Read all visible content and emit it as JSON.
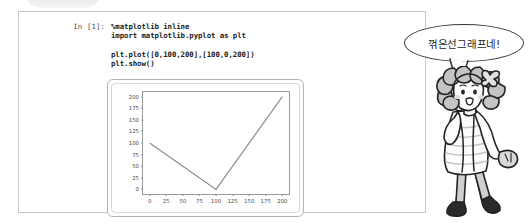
{
  "notebook": {
    "prompt_label": "In [1]:",
    "code_lines": [
      "%matplotlib inline",
      "import matplotlib.pyplot as plt",
      "",
      "plt.plot([0,100,200],[100,0,200])",
      "plt.show()"
    ],
    "code_line_1": "%matplotlib inline",
    "code_line_2": "import matplotlib.pyplot as plt",
    "code_line_3": "plt.plot([0,100,200],[100,0,200])",
    "code_line_4": "plt.show()"
  },
  "speech": {
    "text": "꺾은선그래프네!"
  },
  "character": {
    "name": "curly-haired-girl-illustration",
    "skin_color": "#ffffff",
    "hair_color": "#bfbfbf",
    "outline_color": "#222222"
  },
  "colors": {
    "frame_border": "#c9c9c9",
    "plot_border": "#b4b4b4",
    "axis": "#9a9a9a",
    "line": "#8a8a8a",
    "tick_text": "#4d4d4d",
    "code_text": "#1c1c1c",
    "prompt_text": "#4a4a4a",
    "bubble_outline": "#3a3a3a"
  },
  "chart_data": {
    "type": "line",
    "title": "",
    "xlabel": "",
    "ylabel": "",
    "x": [
      0,
      100,
      200
    ],
    "y": [
      100,
      0,
      200
    ],
    "series": [
      {
        "name": "plot",
        "x": [
          0,
          100,
          200
        ],
        "values": [
          100,
          0,
          200
        ]
      }
    ],
    "xlim": [
      -10,
      210
    ],
    "ylim": [
      -10,
      210
    ],
    "xticks": [
      0,
      25,
      50,
      75,
      100,
      125,
      150,
      175,
      200
    ],
    "yticks": [
      0,
      25,
      50,
      75,
      100,
      125,
      150,
      175,
      200
    ],
    "xtick_labels": [
      "0",
      "25",
      "50",
      "75",
      "100",
      "125",
      "150",
      "175",
      "200"
    ],
    "ytick_labels": [
      "0",
      "25",
      "50",
      "75",
      "100",
      "125",
      "150",
      "175",
      "200"
    ],
    "grid": false,
    "legend": false,
    "legend_position": "none"
  }
}
